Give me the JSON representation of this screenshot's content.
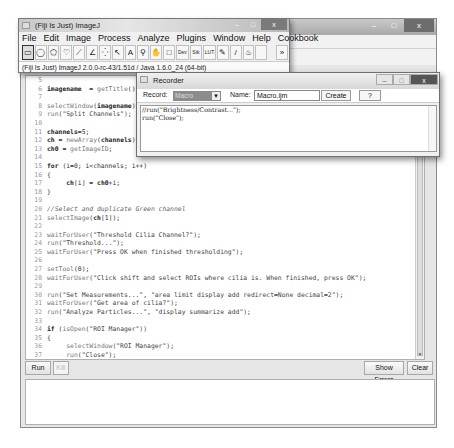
{
  "editor": {
    "title": "",
    "code_lines": [
      {
        "n": "5",
        "html": ""
      },
      {
        "n": "6",
        "parts": [
          [
            "kw",
            "imagename"
          ],
          [
            "",
            "  = "
          ],
          [
            "fn",
            "getTitle"
          ],
          [
            "",
            "();"
          ]
        ]
      },
      {
        "n": "7",
        "parts": []
      },
      {
        "n": "8",
        "parts": [
          [
            "fn",
            "selectWindow"
          ],
          [
            "",
            "("
          ],
          [
            "kw",
            "imagename"
          ],
          [
            "",
            ");"
          ]
        ]
      },
      {
        "n": "9",
        "parts": [
          [
            "fn",
            "run"
          ],
          [
            "str",
            "(\"Split Channels\");"
          ]
        ]
      },
      {
        "n": "10",
        "parts": []
      },
      {
        "n": "11",
        "parts": [
          [
            "kw",
            "channels"
          ],
          [
            "",
            "=5;"
          ]
        ]
      },
      {
        "n": "12",
        "parts": [
          [
            "kw",
            "ch"
          ],
          [
            "",
            " = "
          ],
          [
            "fn",
            "newArray"
          ],
          [
            "",
            "("
          ],
          [
            "kw",
            "channels"
          ],
          [
            "",
            ");"
          ]
        ]
      },
      {
        "n": "13",
        "parts": [
          [
            "kw",
            "ch0"
          ],
          [
            "",
            " = "
          ],
          [
            "fn",
            "getImageID"
          ],
          [
            "",
            ";"
          ]
        ]
      },
      {
        "n": "14",
        "parts": []
      },
      {
        "n": "15",
        "parts": [
          [
            "kw",
            "for"
          ],
          [
            "",
            " (i=0; i<channels; i++)"
          ]
        ]
      },
      {
        "n": "16",
        "parts": [
          [
            "",
            "{"
          ]
        ]
      },
      {
        "n": "17",
        "parts": [
          [
            "",
            "     "
          ],
          [
            "kw",
            "ch"
          ],
          [
            "",
            "[i] = "
          ],
          [
            "kw",
            "ch0"
          ],
          [
            "",
            "+i;"
          ]
        ]
      },
      {
        "n": "18",
        "parts": [
          [
            "",
            "}"
          ]
        ]
      },
      {
        "n": "19",
        "parts": []
      },
      {
        "n": "20",
        "parts": [
          [
            "cmt",
            "//Select and duplicate Green channel"
          ]
        ]
      },
      {
        "n": "21",
        "parts": [
          [
            "fn",
            "selectImage"
          ],
          [
            "",
            "("
          ],
          [
            "kw",
            "ch"
          ],
          [
            "",
            "[1]);"
          ]
        ]
      },
      {
        "n": "22",
        "parts": []
      },
      {
        "n": "23",
        "parts": [
          [
            "fn",
            "waitForUser"
          ],
          [
            "str",
            "(\"Threshold Cilia Channel?\");"
          ]
        ]
      },
      {
        "n": "24",
        "parts": [
          [
            "fn",
            "run"
          ],
          [
            "str",
            "(\"Threshold...\");"
          ]
        ]
      },
      {
        "n": "25",
        "parts": [
          [
            "fn",
            "waitForUser"
          ],
          [
            "str",
            "(\"Press OK when finished thresholding\");"
          ]
        ]
      },
      {
        "n": "26",
        "parts": []
      },
      {
        "n": "27",
        "parts": [
          [
            "fn",
            "setTool"
          ],
          [
            "",
            "(0);"
          ]
        ]
      },
      {
        "n": "28",
        "parts": [
          [
            "fn",
            "waitForUser"
          ],
          [
            "str",
            "(\"Click shift and select ROIs where cilia is. When finished, press OK\");"
          ]
        ]
      },
      {
        "n": "29",
        "parts": []
      },
      {
        "n": "30",
        "parts": [
          [
            "fn",
            "run"
          ],
          [
            "str",
            "(\"Set Measurements...\", \"area limit display add redirect=None decimal=2\");"
          ]
        ]
      },
      {
        "n": "31",
        "parts": [
          [
            "fn",
            "waitForUser"
          ],
          [
            "str",
            "(\"Get area of cilia?\");"
          ]
        ]
      },
      {
        "n": "32",
        "parts": [
          [
            "fn",
            "run"
          ],
          [
            "str",
            "(\"Analyze Particles...\", \"display summarize add\");"
          ]
        ]
      },
      {
        "n": "33",
        "parts": []
      },
      {
        "n": "34",
        "parts": [
          [
            "kw",
            "if"
          ],
          [
            "",
            " ("
          ],
          [
            "fn",
            "isOpen"
          ],
          [
            "str",
            "(\"ROI Manager\"))"
          ]
        ]
      },
      {
        "n": "35",
        "parts": [
          [
            "",
            "{"
          ]
        ]
      },
      {
        "n": "36",
        "parts": [
          [
            "",
            "     "
          ],
          [
            "fn",
            "selectWindow"
          ],
          [
            "str",
            "(\"ROI Manager\");"
          ]
        ]
      },
      {
        "n": "37",
        "parts": [
          [
            "",
            "     "
          ],
          [
            "fn",
            "run"
          ],
          [
            "str",
            "(\"Close\");"
          ]
        ]
      },
      {
        "n": "38",
        "parts": [
          [
            "",
            "}"
          ]
        ]
      }
    ],
    "run_label": "Run",
    "kill_label": "Kill",
    "show_errors_label": "Show Errors",
    "clear_label": "Clear"
  },
  "fiji": {
    "title": "(Fiji Is Just) ImageJ",
    "menus": [
      "File",
      "Edit",
      "Image",
      "Process",
      "Analyze",
      "Plugins",
      "Window",
      "Help",
      "Cookbook"
    ],
    "tools": [
      {
        "name": "rectangle-tool",
        "glyph": "▭",
        "selected": true
      },
      {
        "name": "oval-tool",
        "glyph": "◯"
      },
      {
        "name": "polygon-tool",
        "glyph": "⬠"
      },
      {
        "name": "freehand-tool",
        "glyph": "♡"
      },
      {
        "name": "line-tool",
        "glyph": "⟋"
      },
      {
        "name": "angle-tool",
        "glyph": "∠"
      },
      {
        "name": "point-tool",
        "glyph": "⁛"
      },
      {
        "name": "wand-tool",
        "glyph": "↖"
      },
      {
        "name": "text-tool",
        "glyph": "A"
      },
      {
        "name": "magnifier-tool",
        "glyph": "⚲"
      },
      {
        "name": "hand-tool",
        "glyph": "✋"
      },
      {
        "name": "color-picker-tool",
        "glyph": "□"
      },
      {
        "name": "developer-menu",
        "glyph": "Dev",
        "wide": true
      },
      {
        "name": "stacks-menu",
        "glyph": "Stk",
        "wide": true
      },
      {
        "name": "lut-menu",
        "glyph": "LUT",
        "wide": true
      },
      {
        "name": "pencil-tool",
        "glyph": "✎"
      },
      {
        "name": "brush-tool",
        "glyph": "/"
      },
      {
        "name": "flood-fill-tool",
        "glyph": "♨"
      },
      {
        "name": "empty-slot",
        "glyph": ""
      },
      {
        "name": "more-tools",
        "glyph": "»"
      }
    ],
    "status": "(Fiji Is Just) ImageJ 2.0.0-rc-43/1.51d / Java 1.6.0_24 (64-bit)"
  },
  "recorder": {
    "title": "Recorder",
    "record_label": "Record:",
    "record_value": "Macro",
    "name_label": "Name:",
    "name_value": "Macro.ijm",
    "create_label": "Create",
    "help_label": "?",
    "lines": [
      "//run(\"Brightness/Contrast...\");",
      "run(\"Close\");"
    ]
  },
  "window_controls": {
    "minimize": "–",
    "maximize": "□",
    "close": "x"
  }
}
